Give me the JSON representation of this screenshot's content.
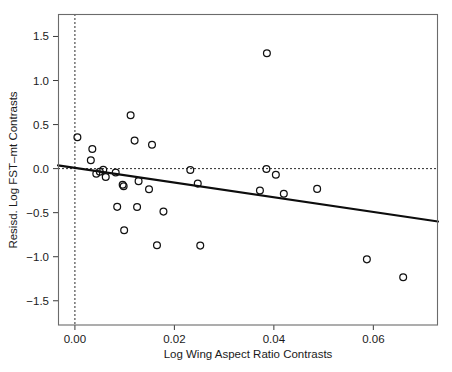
{
  "chart_data": {
    "type": "scatter",
    "title": "",
    "xlabel": "Log Wing Aspect Ratio Contrasts",
    "ylabel": "Resisd. Log FST–mt Contrasts",
    "xlim": [
      -0.0034,
      0.073
    ],
    "ylim": [
      -1.775,
      1.755
    ],
    "xticks": [
      0.0,
      0.02,
      0.04,
      0.06
    ],
    "xticklabels": [
      "0.00",
      "0.02",
      "0.04",
      "0.06"
    ],
    "yticks": [
      1.5,
      1.0,
      0.5,
      0.0,
      -0.5,
      -1.0,
      -1.5
    ],
    "yticklabels": [
      "1.5",
      "1.0",
      "0.5",
      "0.0",
      "−0.5",
      "−1.0",
      "−1.5"
    ],
    "grid": false,
    "legend": null,
    "marker": "open-circle",
    "reference_lines": [
      {
        "name": "vertical-zero-line",
        "orientation": "vertical",
        "value": 0.0,
        "style": "dashed"
      },
      {
        "name": "horizontal-zero-line",
        "orientation": "horizontal",
        "value": 0.0,
        "style": "dashed"
      }
    ],
    "fit_line": {
      "name": "regression-line",
      "style": "solid",
      "x_start": -0.0034,
      "y_start": 0.037,
      "x_end": 0.073,
      "y_end": -0.6,
      "slope": -8.34,
      "intercept": 0.0086
    },
    "points": [
      {
        "x": 0.0005,
        "y": 0.355
      },
      {
        "x": 0.0035,
        "y": 0.222
      },
      {
        "x": 0.0032,
        "y": 0.096
      },
      {
        "x": 0.0043,
        "y": -0.059
      },
      {
        "x": 0.005,
        "y": -0.036
      },
      {
        "x": 0.0057,
        "y": -0.014
      },
      {
        "x": 0.0062,
        "y": -0.096
      },
      {
        "x": 0.0082,
        "y": -0.045
      },
      {
        "x": 0.0112,
        "y": 0.605
      },
      {
        "x": 0.0096,
        "y": -0.184
      },
      {
        "x": 0.0098,
        "y": -0.199
      },
      {
        "x": 0.0085,
        "y": -0.434
      },
      {
        "x": 0.0099,
        "y": -0.7
      },
      {
        "x": 0.012,
        "y": 0.318
      },
      {
        "x": 0.0128,
        "y": -0.142
      },
      {
        "x": 0.0125,
        "y": -0.436
      },
      {
        "x": 0.0155,
        "y": 0.272
      },
      {
        "x": 0.0149,
        "y": -0.235
      },
      {
        "x": 0.0165,
        "y": -0.87
      },
      {
        "x": 0.0178,
        "y": -0.488
      },
      {
        "x": 0.0232,
        "y": -0.015
      },
      {
        "x": 0.0247,
        "y": -0.17
      },
      {
        "x": 0.0252,
        "y": -0.874
      },
      {
        "x": 0.0386,
        "y": 1.31
      },
      {
        "x": 0.0385,
        "y": -0.005
      },
      {
        "x": 0.0404,
        "y": -0.07
      },
      {
        "x": 0.0372,
        "y": -0.248
      },
      {
        "x": 0.042,
        "y": -0.285
      },
      {
        "x": 0.0487,
        "y": -0.23
      },
      {
        "x": 0.0587,
        "y": -1.03
      },
      {
        "x": 0.066,
        "y": -1.232
      }
    ]
  },
  "figure": {
    "plot_area_px": {
      "left": 58,
      "top": 14,
      "right": 438,
      "bottom": 325
    }
  }
}
